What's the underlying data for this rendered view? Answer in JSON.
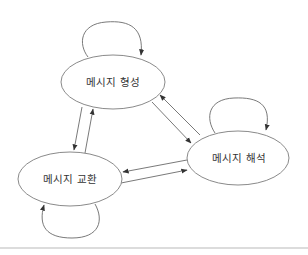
{
  "diagram": {
    "type": "state-transition",
    "nodes": [
      {
        "id": "formation",
        "label": "메시지 형성"
      },
      {
        "id": "interpretation",
        "label": "메시지 해석"
      },
      {
        "id": "exchange",
        "label": "메시지 교환"
      }
    ],
    "edges": [
      {
        "from": "formation",
        "to": "formation",
        "kind": "self-loop"
      },
      {
        "from": "interpretation",
        "to": "interpretation",
        "kind": "self-loop"
      },
      {
        "from": "exchange",
        "to": "exchange",
        "kind": "self-loop"
      },
      {
        "from": "formation",
        "to": "exchange"
      },
      {
        "from": "exchange",
        "to": "formation"
      },
      {
        "from": "formation",
        "to": "interpretation"
      },
      {
        "from": "interpretation",
        "to": "formation"
      },
      {
        "from": "interpretation",
        "to": "exchange"
      },
      {
        "from": "exchange",
        "to": "interpretation"
      }
    ],
    "colors": {
      "stroke": "#8a8a8a",
      "edge": "#6a6a6a",
      "text": "#333333",
      "background": "#ffffff"
    }
  }
}
